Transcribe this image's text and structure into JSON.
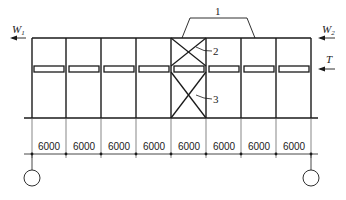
{
  "diagram": {
    "type": "structural-bracing-elevation",
    "labels": {
      "w1": "W",
      "w1_sub": "1",
      "w2": "W",
      "w2_sub": "2",
      "t": "T",
      "callout_1": "1",
      "callout_2": "2",
      "callout_3": "3"
    },
    "bay_count": 8,
    "braced_bay_index": 4,
    "dimensions": [
      "6000",
      "6000",
      "6000",
      "6000",
      "6000",
      "6000",
      "6000",
      "6000"
    ],
    "colors": {
      "line": "#1a1a1a",
      "text": "#222222",
      "background": "#ffffff"
    }
  }
}
